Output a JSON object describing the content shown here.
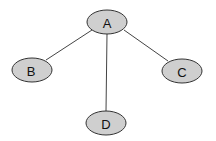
{
  "diagram": {
    "type": "tree",
    "nodes": [
      {
        "id": "A",
        "label": "A",
        "cx": 107,
        "cy": 22
      },
      {
        "id": "B",
        "label": "B",
        "cx": 32,
        "cy": 70
      },
      {
        "id": "C",
        "label": "C",
        "cx": 182,
        "cy": 71
      },
      {
        "id": "D",
        "label": "D",
        "cx": 106,
        "cy": 123
      }
    ],
    "edges": [
      {
        "from": "A",
        "to": "B"
      },
      {
        "from": "A",
        "to": "C"
      },
      {
        "from": "A",
        "to": "D"
      }
    ],
    "colors": {
      "node_fill": "#cfcfcf",
      "node_stroke": "#333333",
      "edge": "#444444"
    }
  }
}
